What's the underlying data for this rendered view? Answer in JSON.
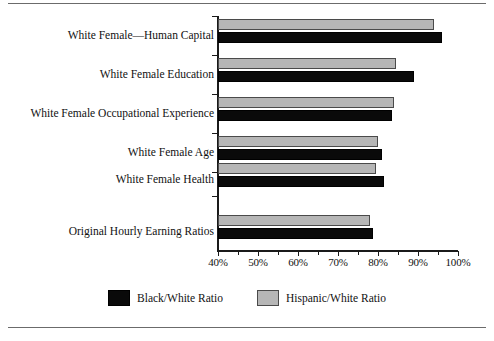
{
  "chart_data": {
    "type": "bar",
    "orientation": "horizontal",
    "title": "",
    "subtitle": "",
    "xlabel": "",
    "ylabel": "",
    "xlim": [
      40,
      100
    ],
    "xticks": [
      40,
      50,
      60,
      70,
      80,
      90,
      100
    ],
    "xtick_labels": [
      "40%",
      "50%",
      "60%",
      "70%",
      "80%",
      "90%",
      "100%"
    ],
    "minor_xticks": [
      45,
      55,
      65,
      75,
      85,
      95
    ],
    "grid": false,
    "legend_position": "bottom-center",
    "categories": [
      "White Female—Human Capital",
      "White Female Education",
      "White Female Occupational Experience",
      "White Female Age",
      "White Female Health",
      "Original Hourly Earning Ratios"
    ],
    "series": [
      {
        "name": "Hispanic/White Ratio",
        "color": "#b6b6b6",
        "values": [
          94.0,
          84.5,
          84.0,
          80.0,
          79.5,
          78.0
        ]
      },
      {
        "name": "Black/White Ratio",
        "color": "#0a0a0a",
        "values": [
          96.0,
          89.0,
          83.5,
          81.0,
          81.5,
          78.8
        ]
      }
    ]
  },
  "legend": {
    "items": [
      {
        "label": "Black/White Ratio",
        "swatch": "black"
      },
      {
        "label": "Hispanic/White Ratio",
        "swatch": "hispanic"
      }
    ]
  }
}
